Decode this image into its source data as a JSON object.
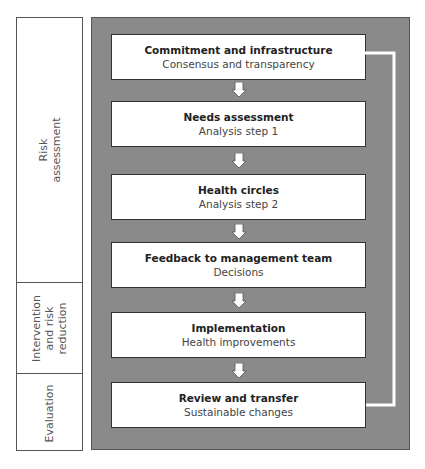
{
  "phases": [
    {
      "label": "Risk\nassessment"
    },
    {
      "label": "Intervention\nand risk\nreduction"
    },
    {
      "label": "Evaluation"
    }
  ],
  "steps": [
    {
      "title": "Commitment and infrastructure",
      "subtitle": "Consensus and transparency"
    },
    {
      "title": "Needs assessment",
      "subtitle": "Analysis step 1"
    },
    {
      "title": "Health circles",
      "subtitle": "Analysis step 2"
    },
    {
      "title": "Feedback to management team",
      "subtitle": "Decisions"
    },
    {
      "title": "Implementation",
      "subtitle": "Health improvements"
    },
    {
      "title": "Review and transfer",
      "subtitle": "Sustainable changes"
    }
  ],
  "colors": {
    "panel": "#8a8a8a",
    "box": "#ffffff",
    "arrow": "#ffffff",
    "border": "#333333"
  },
  "feedback_loop": {
    "from": "Review and transfer",
    "to": "Commitment and infrastructure"
  }
}
